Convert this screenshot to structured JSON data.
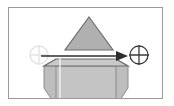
{
  "canvas": {
    "width": 174,
    "height": 106,
    "background_color": "#ffffff",
    "title": "Move geometry preview"
  },
  "frame": {
    "name": "preview-frame",
    "x": 8,
    "y": 7,
    "width": 155,
    "height": 92,
    "stroke_color": "#9a9a9a",
    "stroke_width": 1,
    "fill_color": "#ffffff"
  },
  "shapes": {
    "triangle": {
      "label": "cone-profile-triangle",
      "points": "89,17 113,50 65,50",
      "fill_color": "#b0b0b0",
      "stroke_color": "#6e6e6e",
      "stroke_width": 1.2,
      "opacity": 1
    },
    "prism_top": {
      "label": "prism-top-face",
      "points": "44,66 128,66 116,59 56,59",
      "fill_color": "#c9c9c9",
      "stroke_color": "#6e6e6e",
      "stroke_width": 1.2
    },
    "prism_body": {
      "label": "prism-body-face",
      "points": "44,66 128,66 116,106 56,106",
      "fill_color": "#c4c4c4",
      "stroke_color": "#8c8c8c",
      "stroke_width": 1
    },
    "prism_left_bevel": {
      "label": "prism-left-bevel",
      "points": "44,66 56,59 56,106 44,88",
      "fill_color": "#bdbdbd",
      "stroke_color": "#8c8c8c",
      "stroke_width": 1
    },
    "prism_right_bevel": {
      "label": "prism-right-bevel",
      "points": "128,66 116,59 116,106 128,88",
      "fill_color": "#bdbdbd",
      "stroke_color": "#8c8c8c",
      "stroke_width": 1
    },
    "center_guide_line": {
      "label": "vertical-center-guide",
      "x": 60,
      "y1": 57,
      "y2": 99,
      "stroke_color": "#f2f2f2",
      "stroke_width": 1.4
    }
  },
  "move_vector": {
    "label": "move-arrow",
    "start_x": 41,
    "start_y": 56,
    "end_x": 128,
    "end_y": 56,
    "stroke_color": "#2e2e2e",
    "stroke_width": 1.6,
    "arrowhead_color": "#2e2e2e",
    "arrowhead_length": 12,
    "arrowhead_halfwidth": 5
  },
  "markers": {
    "source": {
      "label": "source-crosshair-marker",
      "cx": 39,
      "cy": 55,
      "r": 9,
      "stroke_color": "#e3e3e3",
      "stroke_width": 1.4,
      "fill_color": "none",
      "cross_color": "#e3e3e3"
    },
    "target": {
      "label": "target-crosshair-marker",
      "cx": 139,
      "cy": 55,
      "r": 9,
      "stroke_color": "#3a3a3a",
      "stroke_width": 1.3,
      "fill_color": "#ffffff",
      "cross_color": "#3a3a3a"
    }
  },
  "accessibility": {
    "diagram_description": "Gray triangle above a gray hexagonal prism with a horizontal arrow pointing right from a faint crosshair to a dark crosshair target"
  }
}
